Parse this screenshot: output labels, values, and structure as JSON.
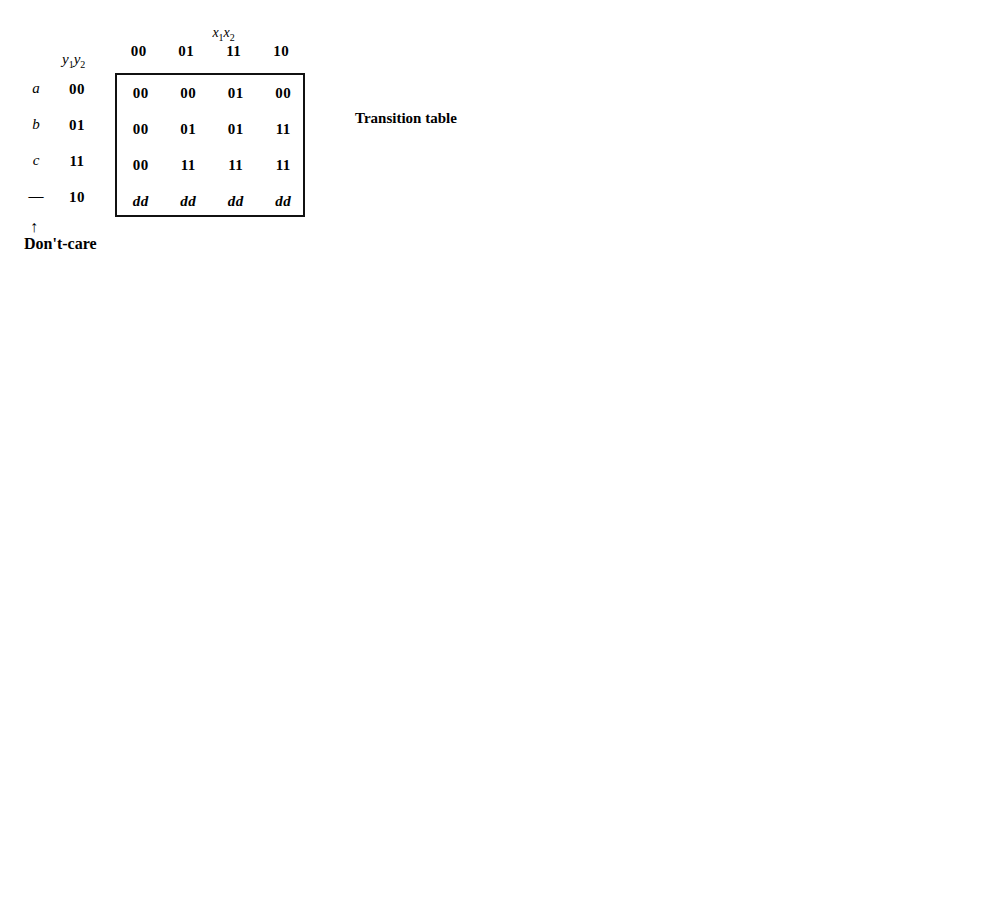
{
  "figure": {
    "caption_a": "(a)",
    "caption_b": "(b)",
    "transition_table_label": "Transition table",
    "dont_care_label": "Don't-care",
    "dont_care_arrow": "↑"
  },
  "axis": {
    "col_var": "x₁x₂",
    "row_var": "y₁y₂",
    "col_headers": [
      "00",
      "01",
      "11",
      "10"
    ],
    "row_headers": [
      "00",
      "01",
      "11",
      "10"
    ],
    "row_states": [
      "a",
      "b",
      "c",
      "—"
    ],
    "row_states_right": [
      "a",
      "b",
      "c",
      ""
    ]
  },
  "chart_data": {
    "type": "table",
    "maps": [
      {
        "id": "transition-table",
        "kind": "transition-table",
        "label": "Transition table",
        "col_var": "x₁x₂",
        "row_var": "y₁y₂",
        "columns": [
          "00",
          "01",
          "11",
          "10"
        ],
        "rows": [
          "00",
          "01",
          "11",
          "10"
        ],
        "states": [
          "a",
          "b",
          "c",
          "—"
        ],
        "cells": [
          [
            "00",
            "00",
            "01",
            "00"
          ],
          [
            "00",
            "01",
            "01",
            "11"
          ],
          [
            "00",
            "11",
            "11",
            "11"
          ],
          [
            "dd",
            "dd",
            "dd",
            "dd"
          ]
        ]
      },
      {
        "id": "map-Y1",
        "kind": "kmap",
        "output": "Y₁",
        "formula": "Y₁ = x₂y₁ + x₁y₁ + x₁x₂′y₂",
        "columns": [
          "00",
          "01",
          "11",
          "10"
        ],
        "rows": [
          "00",
          "01",
          "11",
          "10"
        ],
        "states": [
          "a",
          "b",
          "c",
          "—"
        ],
        "cells": [
          [
            "0",
            "0",
            "0",
            "0"
          ],
          [
            "0",
            "0",
            "0",
            "1"
          ],
          [
            "0",
            "1",
            "1",
            "1"
          ],
          [
            "d",
            "d",
            "d",
            "d"
          ]
        ],
        "loops": [
          {
            "name": "x2y1",
            "cells": [
              [
                2,
                1
              ],
              [
                2,
                2
              ],
              [
                3,
                1
              ],
              [
                3,
                2
              ]
            ]
          },
          {
            "name": "x1y1",
            "cells": [
              [
                2,
                2
              ],
              [
                2,
                3
              ],
              [
                3,
                2
              ],
              [
                3,
                3
              ]
            ]
          },
          {
            "name": "x1x2'y2",
            "cells": [
              [
                1,
                3
              ],
              [
                2,
                3
              ]
            ]
          }
        ]
      },
      {
        "id": "map-Y2",
        "kind": "kmap",
        "output": "Y₂",
        "formula": "Y₂ = x₂y₂ + x₁y₂ + x₁x₂y₁′",
        "columns": [
          "00",
          "01",
          "11",
          "10"
        ],
        "rows": [
          "00",
          "01",
          "11",
          "10"
        ],
        "states": [
          "a",
          "b",
          "c",
          "—"
        ],
        "cells": [
          [
            "0",
            "0",
            "1",
            "0"
          ],
          [
            "0",
            "1",
            "1",
            "1"
          ],
          [
            "0",
            "1",
            "1",
            "1"
          ],
          [
            "d",
            "d",
            "d",
            "d"
          ]
        ],
        "loops": [
          {
            "name": "x2y2",
            "cells": [
              [
                1,
                1
              ],
              [
                1,
                2
              ],
              [
                2,
                1
              ],
              [
                2,
                2
              ]
            ]
          },
          {
            "name": "x1y2",
            "cells": [
              [
                1,
                2
              ],
              [
                1,
                3
              ],
              [
                2,
                2
              ],
              [
                2,
                3
              ]
            ]
          },
          {
            "name": "x1x2y1'",
            "cells": [
              [
                0,
                2
              ],
              [
                1,
                2
              ],
              [
                2,
                2
              ]
            ]
          }
        ]
      },
      {
        "id": "map-z",
        "kind": "kmap",
        "output": "z",
        "formula": "z = y₁′y₂",
        "columns": [
          "00",
          "01",
          "11",
          "10"
        ],
        "rows": [
          "00",
          "01",
          "11",
          "10"
        ],
        "states": [
          "a",
          "b",
          "c",
          "—"
        ],
        "cells": [
          [
            "0",
            "0",
            "0",
            "0"
          ],
          [
            "d",
            "1",
            "1",
            "1"
          ],
          [
            "0",
            "0",
            "0",
            "d"
          ],
          [
            "d",
            "d",
            "d",
            "d"
          ]
        ],
        "loops": [
          {
            "name": "y1'y2",
            "cells": [
              [
                1,
                0
              ],
              [
                1,
                1
              ],
              [
                1,
                2
              ],
              [
                1,
                3
              ]
            ]
          }
        ]
      },
      {
        "id": "map-J1",
        "kind": "kmap",
        "output": "J₁",
        "formula": "J₁ = x₁x₂′y₂",
        "columns": [
          "00",
          "01",
          "11",
          "10"
        ],
        "rows": [
          "00",
          "01",
          "11",
          "10"
        ],
        "states": [
          "a",
          "b",
          "c",
          ""
        ],
        "cells": [
          [
            "0",
            "0",
            "0",
            "0"
          ],
          [
            "0",
            "0",
            "0",
            "1"
          ],
          [
            "d",
            "d",
            "d",
            "d"
          ],
          [
            "d",
            "d",
            "d",
            "d"
          ]
        ],
        "loops": [
          {
            "name": "x1x2'y2",
            "cells": [
              [
                1,
                3
              ],
              [
                2,
                3
              ]
            ]
          }
        ]
      },
      {
        "id": "map-K1",
        "kind": "kmap",
        "output": "K₁",
        "formula": "K₁ = x₁′x₂′",
        "columns": [
          "00",
          "01",
          "11",
          "10"
        ],
        "rows": [
          "00",
          "01",
          "11",
          "10"
        ],
        "states": [
          "a",
          "b",
          "c",
          ""
        ],
        "cells": [
          [
            "d",
            "d",
            "d",
            "d"
          ],
          [
            "d",
            "d",
            "d",
            "d"
          ],
          [
            "1",
            "0",
            "0",
            "0"
          ],
          [
            "d",
            "d",
            "d",
            "d"
          ]
        ],
        "loops": [
          {
            "name": "x1'x2'",
            "cells": [
              [
                0,
                0
              ],
              [
                1,
                0
              ],
              [
                2,
                0
              ],
              [
                3,
                0
              ]
            ]
          }
        ]
      },
      {
        "id": "map-J2",
        "kind": "kmap",
        "output": "J₂",
        "formula": "J₂ = x₁x₂",
        "columns": [
          "00",
          "01",
          "11",
          "10"
        ],
        "rows": [
          "00",
          "01",
          "11",
          "10"
        ],
        "states": [
          "a",
          "b",
          "c",
          ""
        ],
        "cells": [
          [
            "0",
            "0",
            "1",
            "0"
          ],
          [
            "d",
            "d",
            "d",
            "d"
          ],
          [
            "d",
            "d",
            "d",
            "d"
          ],
          [
            "d",
            "d",
            "d",
            "d"
          ]
        ],
        "loops": [
          {
            "name": "x1x2",
            "cells": [
              [
                0,
                2
              ],
              [
                1,
                2
              ],
              [
                2,
                2
              ],
              [
                3,
                2
              ]
            ]
          }
        ]
      },
      {
        "id": "map-K2",
        "kind": "kmap",
        "output": "K₂",
        "formula": "K₂ = x₁′x₂′",
        "columns": [
          "00",
          "01",
          "11",
          "10"
        ],
        "rows": [
          "00",
          "01",
          "11",
          "10"
        ],
        "states": [
          "a",
          "b",
          "c",
          ""
        ],
        "cells": [
          [
            "d",
            "d",
            "d",
            "d"
          ],
          [
            "1",
            "0",
            "0",
            "0"
          ],
          [
            "1",
            "0",
            "0",
            "0"
          ],
          [
            "d",
            "d",
            "d",
            "d"
          ]
        ],
        "loops": [
          {
            "name": "x1'x2'",
            "cells": [
              [
                0,
                0
              ],
              [
                1,
                0
              ],
              [
                2,
                0
              ],
              [
                3,
                0
              ]
            ]
          }
        ]
      }
    ]
  }
}
